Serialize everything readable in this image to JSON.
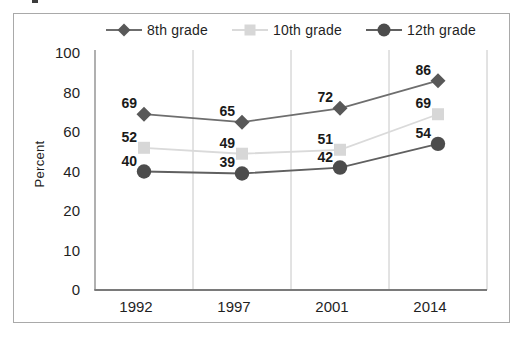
{
  "figure": {
    "background": "#ffffff",
    "frame_border_color": "#a9a9a9",
    "text_color": "#1f1f1f",
    "gridline_color": "#c6c6c6",
    "y_axis_color": "#8f8f8f",
    "x_axis_color": "#7a7a7a"
  },
  "chart_data": {
    "type": "line",
    "title": "",
    "xlabel": "",
    "ylabel": "Percent",
    "categories": [
      "1992",
      "1997",
      "2001",
      "2014"
    ],
    "series": [
      {
        "name": "8th grade",
        "marker": "diamond",
        "marker_color": "#585858",
        "line_color": "#6e6e6e",
        "values": [
          69,
          65,
          72,
          86
        ]
      },
      {
        "name": "10th grade",
        "marker": "square",
        "marker_color": "#d7d7d7",
        "line_color": "#dadada",
        "values": [
          52,
          49,
          51,
          69
        ]
      },
      {
        "name": "12th grade",
        "marker": "circle",
        "marker_color": "#4c4c4c",
        "line_color": "#606060",
        "values": [
          40,
          39,
          42,
          54
        ]
      }
    ],
    "y_ticks": [
      100,
      80,
      60,
      40,
      20,
      10,
      0
    ],
    "axis_note": "y tick marks are evenly spaced even though intervals are unequal (20,20,20,20,10,10)",
    "grid": "vertical-gridlines-only",
    "legend_position": "top",
    "data_labels": "shown above-left of each marker"
  }
}
